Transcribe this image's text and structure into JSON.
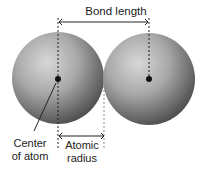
{
  "diagram": {
    "labels": {
      "bond_length": "Bond length",
      "center_line1": "Center",
      "center_line2": "of atom",
      "radius_line1": "Atomic",
      "radius_line2": "radius"
    },
    "atoms": [
      {
        "name": "left-atom",
        "cx": 58,
        "cy": 78,
        "r": 46
      },
      {
        "name": "right-atom",
        "cx": 149,
        "cy": 78,
        "r": 46
      }
    ],
    "colors": {
      "sphere_light": "#d4d4d4",
      "sphere_dark": "#4a4a4a",
      "line": "#222222"
    }
  }
}
